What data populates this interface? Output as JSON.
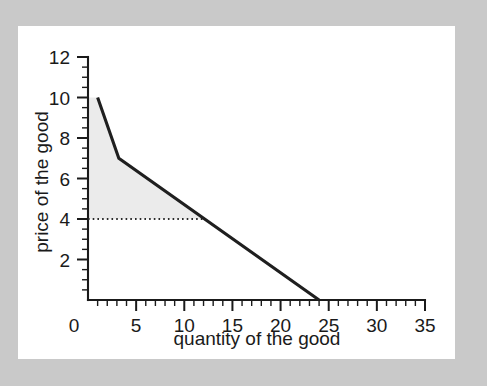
{
  "figure": {
    "background_color": "#c9c9c9",
    "card_color": "#ffffff"
  },
  "chart_data": {
    "type": "line",
    "title": "",
    "xlabel": "quantity of the good",
    "ylabel": "price of the good",
    "xlim": [
      0,
      35
    ],
    "ylim": [
      0,
      12
    ],
    "grid": false,
    "legend": null,
    "x_ticks": [
      0,
      5,
      10,
      15,
      20,
      25,
      30,
      35
    ],
    "x_tick_labels": [
      "0",
      "5",
      "10",
      "15",
      "20",
      "25",
      "30",
      "35"
    ],
    "x_minor_tick_step": 1,
    "y_ticks": [
      0,
      2,
      4,
      6,
      8,
      10,
      12
    ],
    "y_tick_labels": [
      "0",
      "2",
      "4",
      "6",
      "8",
      "10",
      "12"
    ],
    "y_minor_tick_step": 0.5,
    "y_tick_labels_shown": [
      "2",
      "4",
      "6",
      "8",
      "10",
      "12"
    ],
    "series": [
      {
        "name": "demand curve",
        "type": "line",
        "color": "#1f1f1f",
        "points": [
          {
            "x": 1.0,
            "y": 10.0
          },
          {
            "x": 3.2,
            "y": 7.0
          },
          {
            "x": 24.0,
            "y": 0.0
          }
        ]
      }
    ],
    "annotations": [
      {
        "name": "price-level-dotted-line",
        "type": "horizontal-dotted-line",
        "y": 4.0,
        "x_start": 0.0,
        "x_end": 11.9,
        "color": "#2a2a2a",
        "style": "dotted"
      },
      {
        "name": "consumer-surplus-region",
        "type": "shaded-area",
        "color": "#ebebeb",
        "description": "area under demand curve above price 4",
        "vertices": [
          {
            "x": 0.0,
            "y": 10.0
          },
          {
            "x": 1.0,
            "y": 10.0
          },
          {
            "x": 3.2,
            "y": 7.0
          },
          {
            "x": 11.9,
            "y": 4.0
          },
          {
            "x": 0.0,
            "y": 4.0
          }
        ]
      }
    ]
  }
}
